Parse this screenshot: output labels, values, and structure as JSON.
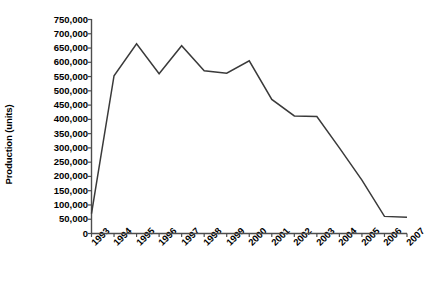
{
  "chart_data": {
    "type": "line",
    "title": "",
    "xlabel": "",
    "ylabel": "Production (units)",
    "categories": [
      "1993",
      "1994",
      "1995",
      "1996",
      "1997",
      "1998",
      "1999",
      "2000",
      "2001",
      "2002",
      "2003",
      "2004",
      "2005",
      "2006",
      "2007"
    ],
    "values": [
      70000,
      553000,
      665000,
      560000,
      658000,
      570000,
      562000,
      605000,
      470000,
      412000,
      410000,
      300000,
      187000,
      60000,
      57000
    ],
    "series": [
      {
        "name": "Production",
        "values": [
          70000,
          553000,
          665000,
          560000,
          658000,
          570000,
          562000,
          605000,
          470000,
          412000,
          410000,
          300000,
          187000,
          60000,
          57000
        ]
      }
    ],
    "ylim": [
      0,
      750000
    ],
    "y_ticks": [
      0,
      50000,
      100000,
      150000,
      200000,
      250000,
      300000,
      350000,
      400000,
      450000,
      500000,
      550000,
      600000,
      650000,
      700000,
      750000
    ],
    "y_tick_labels": [
      "0",
      "50,000",
      "100,000",
      "150,000",
      "200,000",
      "250,000",
      "300,000",
      "350,000",
      "400,000",
      "450,000",
      "500,000",
      "550,000",
      "600,000",
      "650,000",
      "700,000",
      "750,000"
    ],
    "grid": false,
    "legend": false,
    "legend_position": "none",
    "line_color": "#3a3a3a",
    "axis_color": "#4d4d4d",
    "background_color": "#ffffff",
    "x_tick_label_rotation": 45
  }
}
